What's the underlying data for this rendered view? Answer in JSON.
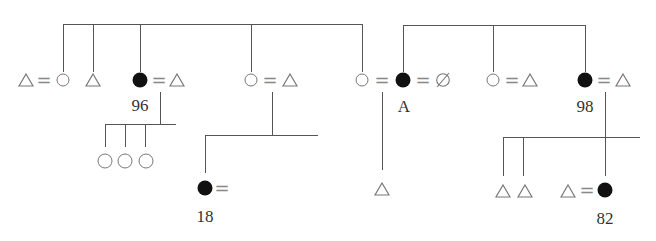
{
  "diagram": {
    "type": "pedigree",
    "legend_note": "circle = female, triangle = male, filled circle = affected female, circle with slash = null/deceased",
    "labels": {
      "individual_96": "96",
      "individual_A": "A",
      "individual_98": "98",
      "individual_18": "18",
      "individual_82": "82"
    },
    "equals_sign": "=",
    "generation_1_left": [
      {
        "couple": [
          "male",
          "female"
        ]
      },
      {
        "single": "male"
      },
      {
        "couple": [
          "affected-female",
          "male"
        ],
        "label": "96"
      },
      {
        "couple": [
          "female",
          "male"
        ]
      },
      {
        "couple": [
          "female",
          "affected-female",
          "null"
        ],
        "label": "A"
      }
    ],
    "generation_1_right": [
      {
        "couple": [
          "affected-female",
          "null"
        ],
        "label": "A"
      },
      {
        "couple": [
          "female",
          "male"
        ]
      },
      {
        "couple": [
          "affected-female",
          "male"
        ],
        "label": "98"
      }
    ],
    "generation_2": [
      {
        "parent": "96",
        "children": [
          "female",
          "female",
          "female"
        ]
      },
      {
        "parent": "female=male (middle)",
        "children": [
          {
            "affected-female-married": true,
            "label": "18"
          }
        ]
      },
      {
        "parent": "A",
        "children": [
          "male"
        ]
      },
      {
        "parent": "98",
        "children": [
          "male",
          "male",
          {
            "couple": [
              "male",
              "affected-female"
            ],
            "label": "82"
          }
        ]
      }
    ]
  }
}
